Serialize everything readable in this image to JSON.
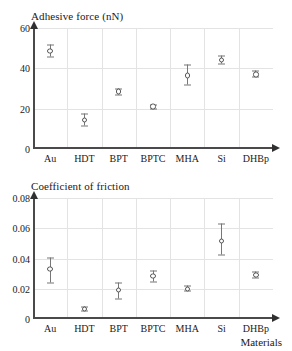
{
  "figure": {
    "background_color": "#ffffff",
    "page_color": "#e8e8e8",
    "marker_color": "#555555",
    "grid_color": "#e3e3e3",
    "axis_color": "#4a4a4a"
  },
  "xaxis": {
    "label": "Materials",
    "categories": [
      "Au",
      "HDT",
      "BPT",
      "BPTC",
      "MHA",
      "Si",
      "DHBp"
    ]
  },
  "chart_data": [
    {
      "type": "scatter",
      "title": "Adhesive force (nN)",
      "xlabel": "",
      "ylabel": "Adhesive force (nN)",
      "categories": [
        "Au",
        "HDT",
        "BPT",
        "BPTC",
        "MHA",
        "Si",
        "DHBp"
      ],
      "values": [
        48.5,
        14.5,
        28.5,
        21.0,
        36.5,
        44.0,
        37.0
      ],
      "error_low": [
        3.0,
        3.0,
        1.5,
        1.0,
        5.0,
        2.0,
        1.5
      ],
      "error_high": [
        3.0,
        3.0,
        1.5,
        1.0,
        5.0,
        2.0,
        1.5
      ],
      "ylim": [
        0,
        60
      ],
      "yticks": [
        0,
        20,
        40,
        60
      ],
      "ytick_labels": [
        "0",
        "20",
        "40",
        "60"
      ],
      "grid": true,
      "legend": "none"
    },
    {
      "type": "scatter",
      "title": "Coefficient of friction",
      "xlabel": "Materials",
      "ylabel": "Coefficient of friction",
      "categories": [
        "Au",
        "HDT",
        "BPT",
        "BPTC",
        "MHA",
        "Si",
        "DHBp"
      ],
      "values": [
        0.033,
        0.0065,
        0.019,
        0.0285,
        0.02,
        0.0515,
        0.029
      ],
      "error_low": [
        0.0095,
        0.0015,
        0.006,
        0.004,
        0.0015,
        0.0095,
        0.002
      ],
      "error_high": [
        0.0075,
        0.0015,
        0.005,
        0.0035,
        0.0015,
        0.011,
        0.002
      ],
      "ylim": [
        0,
        0.08
      ],
      "yticks": [
        0,
        0.02,
        0.04,
        0.06,
        0.08
      ],
      "ytick_labels": [
        "0",
        "0.02",
        "0.04",
        "0.06",
        "0.08"
      ],
      "grid": true,
      "legend": "none"
    }
  ]
}
